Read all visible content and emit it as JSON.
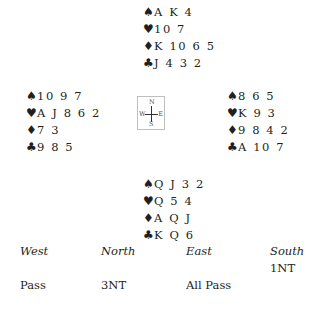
{
  "deal": {
    "north": {
      "spades": "A K 4",
      "hearts": "10 7",
      "diamonds": "K 10 6 5",
      "clubs": "J 4 3 2"
    },
    "west": {
      "spades": "10 9 7",
      "hearts": "A J 8 6 2",
      "diamonds": "7 3",
      "clubs": "9 8 5"
    },
    "east": {
      "spades": "8 6 5",
      "hearts": "K 9 3",
      "diamonds": "9 8 4 2",
      "clubs": "A 10 7"
    },
    "south": {
      "spades": "Q J 3 2",
      "hearts": "Q 5 4",
      "diamonds": "A Q J",
      "clubs": "K Q 6"
    }
  },
  "suit_symbols": {
    "spades": "♠",
    "hearts": "♥",
    "diamonds": "♦",
    "clubs": "♣"
  },
  "compass": {
    "n": "N",
    "s": "S",
    "w": "W",
    "e": "E"
  },
  "bidding": {
    "headers": [
      "West",
      "North",
      "East",
      "South"
    ],
    "rows": [
      [
        "",
        "",
        "",
        "1NT"
      ],
      [
        "Pass",
        "3NT",
        "All Pass",
        ""
      ]
    ]
  }
}
